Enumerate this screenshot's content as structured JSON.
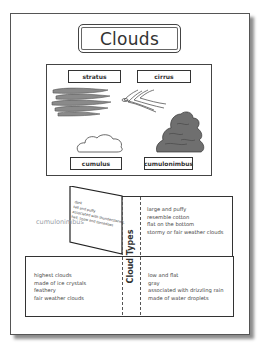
{
  "title": "Clouds",
  "picture_panel": {
    "labels": [
      {
        "id": "stratus",
        "text": "stratus"
      },
      {
        "id": "cirrus",
        "text": "cirrus"
      },
      {
        "id": "cumulus",
        "text": "cumulus"
      },
      {
        "id": "cumulonimbus",
        "text": "cumulonimbus"
      }
    ],
    "illustrations": [
      "stratus-cloud-drawing",
      "cirrus-cloud-drawing",
      "cumulus-cloud-drawing",
      "cumulonimbus-cloud-drawing"
    ]
  },
  "foldable": {
    "center_title": "Cloud Types",
    "ghost_label": "cumulonimbus",
    "flap_lines": [
      "dark",
      "tall and puffy",
      "associated with thunderstorms,",
      "hail, snow and tornadoes"
    ],
    "top_right_lines": [
      "large and puffy",
      "resemble cotton",
      "flat on the bottom",
      "stormy or fair weather clouds"
    ],
    "bottom_left_lines": [
      "highest clouds",
      "made of ice crystals",
      "feathery",
      "fair weather clouds"
    ],
    "bottom_right_lines": [
      "low and flat",
      "gray",
      "associated with drizzling rain",
      "made of water droplets"
    ]
  },
  "colors": {
    "border": "#444444",
    "cloud_dark": "#6b6b6b",
    "cloud_light": "#a8a8a8",
    "ghost_text": "#9aa0a8"
  }
}
